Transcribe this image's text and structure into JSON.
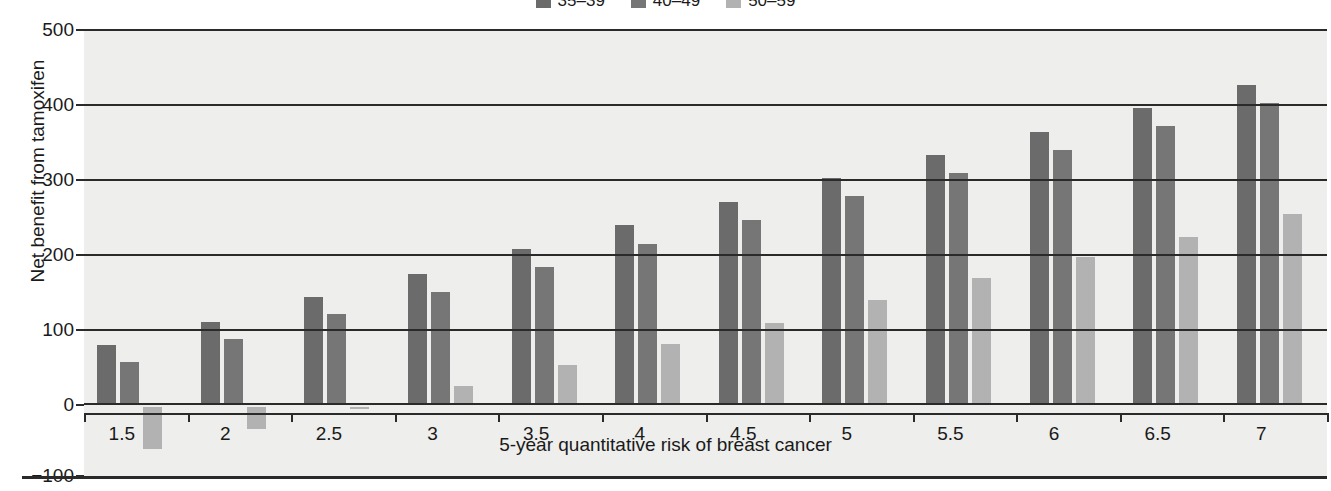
{
  "chart_data": {
    "type": "bar",
    "title": "",
    "xlabel": "5-year quantitative risk of breast cancer",
    "ylabel": "Net benefit from tamoxifen",
    "categories": [
      "1.5",
      "2",
      "2.5",
      "3",
      "3.5",
      "4",
      "4.5",
      "5",
      "5.5",
      "6",
      "6.5",
      "7"
    ],
    "series": [
      {
        "name": "35–39",
        "color": "#6b6b6b",
        "values": [
          80,
          111,
          144,
          175,
          208,
          240,
          271,
          303,
          333,
          364,
          396,
          427
        ]
      },
      {
        "name": "40–49",
        "color": "#767676",
        "values": [
          58,
          88,
          121,
          151,
          184,
          215,
          247,
          279,
          309,
          340,
          372,
          403
        ]
      },
      {
        "name": "50–59",
        "color": "#b2b2b2",
        "values": [
          -60,
          -32,
          -3,
          25,
          53,
          82,
          110,
          140,
          169,
          198,
          224,
          255
        ]
      }
    ],
    "ylim": [
      -100,
      500
    ],
    "yticks": [
      500,
      400,
      300,
      200,
      100,
      0,
      -100
    ],
    "ytick_labels": [
      "500",
      "400",
      "300",
      "200",
      "100",
      "0",
      "−100"
    ],
    "grid": true,
    "legend_position": "top-center",
    "plot_background": "#eeeeec",
    "axis_color": "#2a2a2a"
  },
  "legend": {
    "items": [
      {
        "label": "35–39",
        "color": "#6b6b6b"
      },
      {
        "label": "40–49",
        "color": "#767676"
      },
      {
        "label": "50–59",
        "color": "#b2b2b2"
      }
    ]
  }
}
